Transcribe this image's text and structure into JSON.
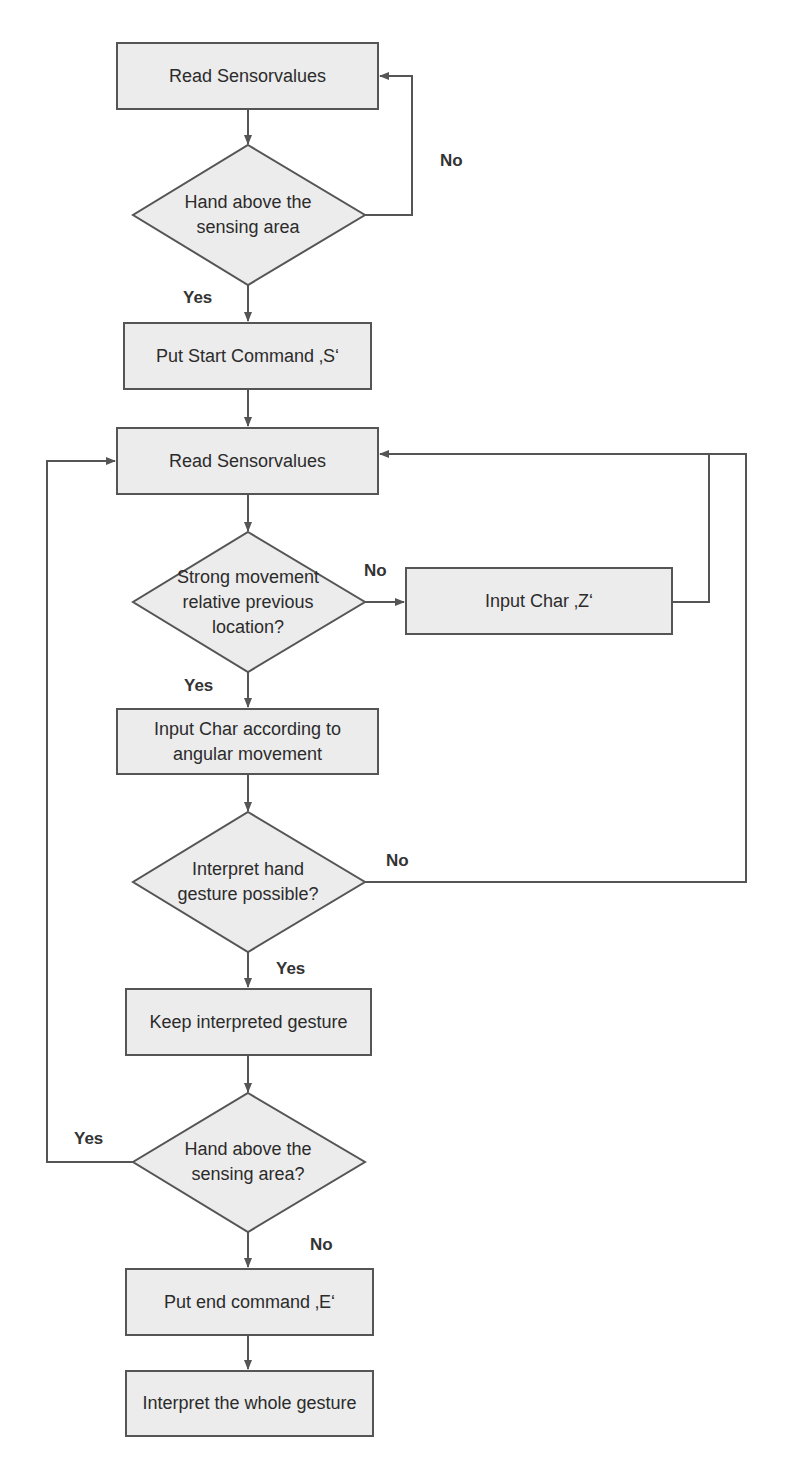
{
  "diagram": {
    "type": "flowchart",
    "colors": {
      "box_fill": "#ececec",
      "box_border": "#555555",
      "line": "#555555",
      "text": "#2b2b2b"
    },
    "nodes": [
      {
        "id": "n1",
        "shape": "process",
        "label": "Read Sensorvalues"
      },
      {
        "id": "d1",
        "shape": "decision",
        "label": "Hand above the sensing area"
      },
      {
        "id": "n2",
        "shape": "process",
        "label": "Put Start Command ‚S‘"
      },
      {
        "id": "n3",
        "shape": "process",
        "label": "Read Sensorvalues"
      },
      {
        "id": "d2",
        "shape": "decision",
        "label": "Strong movement relative previous location?"
      },
      {
        "id": "n4",
        "shape": "process",
        "label": "Input Char ‚Z‘"
      },
      {
        "id": "n5",
        "shape": "process",
        "label": "Input Char according to angular movement"
      },
      {
        "id": "d3",
        "shape": "decision",
        "label": "Interpret hand gesture possible?"
      },
      {
        "id": "n6",
        "shape": "process",
        "label": "Keep interpreted gesture"
      },
      {
        "id": "d4",
        "shape": "decision",
        "label": "Hand above the sensing area?"
      },
      {
        "id": "n7",
        "shape": "process",
        "label": "Put end command ‚E‘"
      },
      {
        "id": "n8",
        "shape": "process",
        "label": "Interpret the whole gesture"
      }
    ],
    "edges": [
      {
        "from": "n1",
        "to": "d1",
        "label": ""
      },
      {
        "from": "d1",
        "to": "n1",
        "label": "No"
      },
      {
        "from": "d1",
        "to": "n2",
        "label": "Yes"
      },
      {
        "from": "n2",
        "to": "n3",
        "label": ""
      },
      {
        "from": "n3",
        "to": "d2",
        "label": ""
      },
      {
        "from": "d2",
        "to": "n4",
        "label": "No"
      },
      {
        "from": "n4",
        "to": "n3",
        "label": ""
      },
      {
        "from": "d2",
        "to": "n5",
        "label": "Yes"
      },
      {
        "from": "n5",
        "to": "d3",
        "label": ""
      },
      {
        "from": "d3",
        "to": "n3",
        "label": "No"
      },
      {
        "from": "d3",
        "to": "n6",
        "label": "Yes"
      },
      {
        "from": "n6",
        "to": "d4",
        "label": ""
      },
      {
        "from": "d4",
        "to": "n3",
        "label": "Yes"
      },
      {
        "from": "d4",
        "to": "n7",
        "label": "No"
      },
      {
        "from": "n7",
        "to": "n8",
        "label": ""
      }
    ]
  }
}
